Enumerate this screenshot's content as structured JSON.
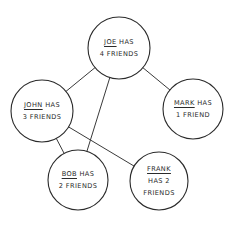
{
  "diagram": {
    "type": "friendship-graph",
    "nodes": [
      {
        "id": "joe",
        "name": "Joe",
        "line1_rest": " has",
        "line2": "4 friends",
        "line3": "",
        "cx": 119,
        "cy": 48,
        "r": 31
      },
      {
        "id": "john",
        "name": "John",
        "line1_rest": " has",
        "line2": "3 friends",
        "line3": "",
        "cx": 42,
        "cy": 111,
        "r": 31
      },
      {
        "id": "mark",
        "name": "Mark",
        "line1_rest": " has",
        "line2": "1 friend",
        "line3": "",
        "cx": 193,
        "cy": 109,
        "r": 30
      },
      {
        "id": "bob",
        "name": "Bob",
        "line1_rest": " has",
        "line2": "2 friends",
        "line3": "",
        "cx": 78,
        "cy": 180,
        "r": 30
      },
      {
        "id": "frank",
        "name": "Frank",
        "line1_rest": "",
        "line2": "has 2",
        "line3": "friends",
        "cx": 159,
        "cy": 181,
        "r": 29
      }
    ],
    "edges": [
      {
        "from": "joe",
        "to": "john"
      },
      {
        "from": "joe",
        "to": "mark"
      },
      {
        "from": "joe",
        "to": "bob"
      },
      {
        "from": "john",
        "to": "bob"
      },
      {
        "from": "john",
        "to": "frank"
      }
    ],
    "colors": {
      "stroke": "#2a2a2a",
      "background": "#ffffff"
    }
  }
}
